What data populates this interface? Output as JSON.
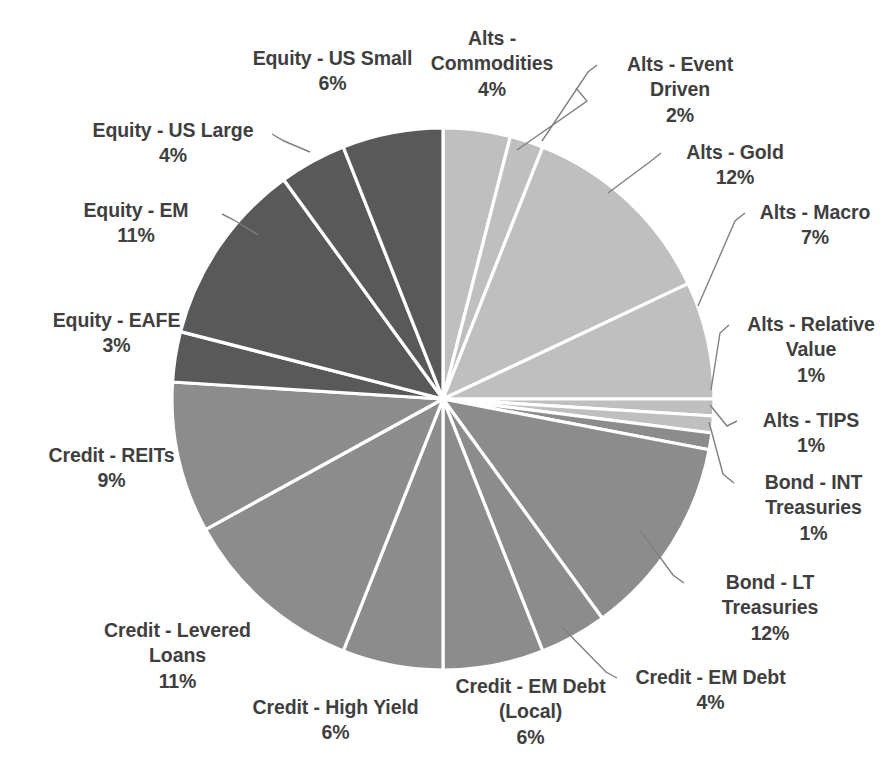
{
  "chart_data": {
    "type": "pie",
    "title": "",
    "subtitle": "",
    "xlabel": "",
    "ylabel": "",
    "legend_position": "none",
    "grid": false,
    "label_format": "{name} {value}%",
    "start_angle_deg": 0,
    "direction": "clockwise",
    "categories": [
      "Alts - Commodities",
      "Alts - Event Driven",
      "Alts - Gold",
      "Alts - Macro",
      "Alts - Relative Value",
      "Alts - TIPS",
      "Bond - INT Treasuries",
      "Bond - LT Treasuries",
      "Credit - EM Debt",
      "Credit - EM Debt (Local)",
      "Credit - High Yield",
      "Credit - Levered Loans",
      "Credit - REITs",
      "Equity - EAFE",
      "Equity - EM",
      "Equity - US Large",
      "Equity - US Small"
    ],
    "values": [
      4,
      2,
      12,
      7,
      1,
      1,
      1,
      12,
      4,
      6,
      6,
      11,
      9,
      3,
      11,
      4,
      6
    ],
    "unit": "%",
    "total": 100,
    "colors": [
      "#bfbfbf",
      "#bfbfbf",
      "#bfbfbf",
      "#bfbfbf",
      "#bfbfbf",
      "#bfbfbf",
      "#8c8c8c",
      "#8c8c8c",
      "#8c8c8c",
      "#8c8c8c",
      "#8c8c8c",
      "#8c8c8c",
      "#8c8c8c",
      "#595959",
      "#595959",
      "#595959",
      "#595959"
    ]
  },
  "slices": [
    {
      "name": "Alts - Commodities",
      "pct_label": "4%",
      "value": 4,
      "color": "#bfbfbf",
      "label_lines": "Alts -\nCommodities",
      "label_x": 402,
      "label_y": 26,
      "label_w": 180,
      "leader": "M 576 88 L 587 101 L 517 150"
    },
    {
      "name": "Alts - Event Driven",
      "pct_label": "2%",
      "value": 2,
      "color": "#bfbfbf",
      "label_lines": "Alts - Event\nDriven",
      "label_x": 600,
      "label_y": 52,
      "label_w": 160,
      "leader": "M 597 65 L 588 72 L 542 141"
    },
    {
      "name": "Alts - Gold",
      "pct_label": "12%",
      "value": 12,
      "color": "#bfbfbf",
      "label_lines": "Alts - Gold",
      "label_x": 650,
      "label_y": 140,
      "label_w": 170,
      "leader": "M 661 153 L 651 161 L 608 193"
    },
    {
      "name": "Alts - Macro",
      "pct_label": "7%",
      "value": 7,
      "color": "#bfbfbf",
      "label_lines": "Alts - Macro",
      "label_x": 735,
      "label_y": 200,
      "label_w": 160,
      "leader": "M 745 213 L 735 221 L 698 306"
    },
    {
      "name": "Alts - Relative Value",
      "pct_label": "1%",
      "value": 1,
      "color": "#bfbfbf",
      "label_lines": "Alts - Relative\nValue",
      "label_x": 726,
      "label_y": 312,
      "label_w": 170,
      "leader": "M 729 325 L 720 333 L 711 390"
    },
    {
      "name": "Alts - TIPS",
      "pct_label": "1%",
      "value": 1,
      "color": "#bfbfbf",
      "label_lines": "Alts - TIPS",
      "label_x": 736,
      "label_y": 408,
      "label_w": 150,
      "leader": "M 737 421 L 727 426 L 710 405"
    },
    {
      "name": "Bond - INT Treasuries",
      "pct_label": "1%",
      "value": 1,
      "color": "#8c8c8c",
      "label_lines": "Bond - INT\nTreasuries",
      "label_x": 731,
      "label_y": 470,
      "label_w": 165,
      "leader": "M 734 483 L 723 474 L 709 422"
    },
    {
      "name": "Bond - LT Treasuries",
      "pct_label": "12%",
      "value": 12,
      "color": "#8c8c8c",
      "label_lines": "Bond - LT\nTreasuries",
      "label_x": 685,
      "label_y": 570,
      "label_w": 170,
      "leader": "M 684 583 L 673 575 L 640 530"
    },
    {
      "name": "Credit - EM Debt",
      "pct_label": "4%",
      "value": 4,
      "color": "#8c8c8c",
      "label_lines": "Credit - EM Debt",
      "label_x": 618,
      "label_y": 665,
      "label_w": 185,
      "leader": "M 617 678 L 606 672 L 561 626"
    },
    {
      "name": "Credit - EM Debt (Local)",
      "pct_label": "6%",
      "value": 6,
      "color": "#8c8c8c",
      "label_lines": "Credit - EM Debt\n(Local)",
      "label_x": 438,
      "label_y": 674,
      "label_w": 185,
      "leader": ""
    },
    {
      "name": "Credit - High Yield",
      "pct_label": "6%",
      "value": 6,
      "color": "#8c8c8c",
      "label_lines": "Credit - High Yield",
      "label_x": 243,
      "label_y": 695,
      "label_w": 185,
      "leader": ""
    },
    {
      "name": "Credit - Levered Loans",
      "pct_label": "11%",
      "value": 11,
      "color": "#8c8c8c",
      "label_lines": "Credit - Levered\nLoans",
      "label_x": 85,
      "label_y": 618,
      "label_w": 185,
      "leader": ""
    },
    {
      "name": "Credit - REITs",
      "pct_label": "9%",
      "value": 9,
      "color": "#8c8c8c",
      "label_lines": "Credit - REITs",
      "label_x": 24,
      "label_y": 443,
      "label_w": 175,
      "leader": ""
    },
    {
      "name": "Equity - EAFE",
      "pct_label": "3%",
      "value": 3,
      "color": "#595959",
      "label_lines": "Equity - EAFE",
      "label_x": 29,
      "label_y": 308,
      "label_w": 175,
      "leader": ""
    },
    {
      "name": "Equity - EM",
      "pct_label": "11%",
      "value": 11,
      "color": "#595959",
      "label_lines": "Equity - EM",
      "label_x": 56,
      "label_y": 198,
      "label_w": 160,
      "leader": "M 222 214 L 234 220 L 258 235"
    },
    {
      "name": "Equity - US Large",
      "pct_label": "4%",
      "value": 4,
      "color": "#595959",
      "label_lines": "Equity - US Large",
      "label_x": 78,
      "label_y": 118,
      "label_w": 190,
      "leader": "M 272 134 L 284 141 L 310 152"
    },
    {
      "name": "Equity - US Small",
      "pct_label": "6%",
      "value": 6,
      "color": "#595959",
      "label_lines": "Equity - US Small",
      "label_x": 235,
      "label_y": 46,
      "label_w": 195,
      "leader": ""
    }
  ],
  "geometry": {
    "cx": 443,
    "cy": 399,
    "r": 271
  }
}
